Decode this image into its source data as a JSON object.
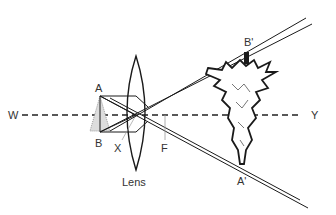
{
  "diagram": {
    "labels": {
      "axis_left": "W",
      "axis_right": "Y",
      "object_top": "A",
      "object_bottom": "B",
      "optical_center": "X",
      "focus": "F",
      "image_top": "B'",
      "image_bottom": "A'",
      "lens": "Lens"
    },
    "colors": {
      "line": "#1a1a1a",
      "background": "#ffffff"
    }
  }
}
